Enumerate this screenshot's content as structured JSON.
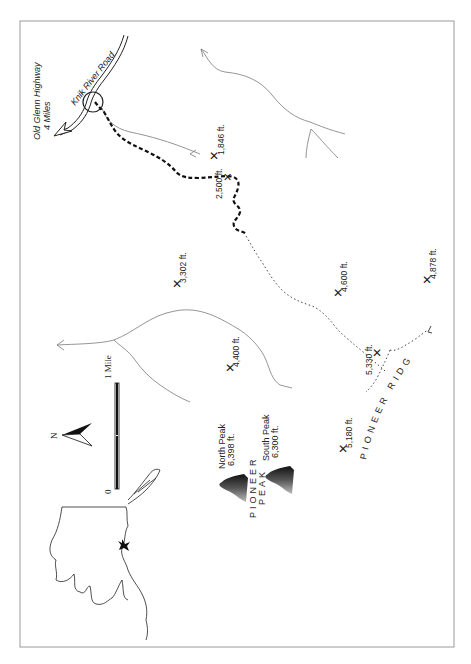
{
  "map": {
    "roads": {
      "highway_label_line1": "Old Glenn Highway",
      "highway_label_line2": "4 Miles",
      "river_road_label": "Knik River Road"
    },
    "elevations": [
      {
        "id": "e1846",
        "label": "1,846 ft."
      },
      {
        "id": "e2500",
        "label": "2,500 ft."
      },
      {
        "id": "e3302",
        "label": "3,302 ft."
      },
      {
        "id": "e4400",
        "label": "4,400 ft."
      },
      {
        "id": "e4600",
        "label": "4,600 ft."
      },
      {
        "id": "e4878",
        "label": "4,878 ft."
      },
      {
        "id": "e5330",
        "label": "5,330 ft."
      },
      {
        "id": "e5180",
        "label": "5,180 ft."
      }
    ],
    "peaks": {
      "north_name": "North Peak",
      "north_elev": "6,398 ft.",
      "south_name": "South Peak",
      "south_elev": "6,300 ft.",
      "massif_line1": "PIONEER",
      "massif_line2": "PEAK"
    },
    "ridge_label": "PIONEER RIDGE",
    "scale": {
      "zero": "0",
      "one": "1 Mile"
    },
    "north_arrow_label": "N",
    "colors": {
      "trail": "#111111",
      "route": "#444444",
      "stream": "#7a7a7a",
      "border": "#9a9a9a"
    }
  }
}
